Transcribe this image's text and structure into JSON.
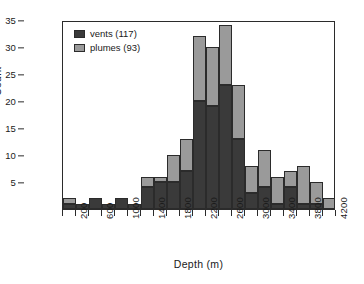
{
  "chart_data": {
    "type": "bar",
    "subtype": "stacked-histogram",
    "title": "",
    "xlabel": "Depth (m)",
    "ylabel": "Count",
    "xlim": [
      0,
      4200
    ],
    "ylim": [
      0,
      35
    ],
    "bin_width": 200,
    "grid": false,
    "legend_position": "top-left",
    "x_tick_labels": [
      "200",
      "600",
      "1000",
      "1400",
      "1800",
      "2200",
      "2600",
      "3000",
      "3400",
      "3800",
      "4200"
    ],
    "x_tick_values": [
      200,
      600,
      1000,
      1400,
      1800,
      2200,
      2600,
      3000,
      3400,
      3800,
      4200
    ],
    "x_minor_tick_values": [
      0,
      400,
      800,
      1200,
      1600,
      2000,
      2400,
      2800,
      3200,
      3600,
      4000
    ],
    "y_tick_labels": [
      "5",
      "10",
      "15",
      "20",
      "25",
      "30",
      "35"
    ],
    "y_tick_values": [
      5,
      10,
      15,
      20,
      25,
      30,
      35
    ],
    "bin_starts": [
      0,
      200,
      400,
      600,
      800,
      1000,
      1200,
      1400,
      1600,
      1800,
      2000,
      2200,
      2400,
      2600,
      2800,
      3000,
      3200,
      3400,
      3600,
      3800,
      4000
    ],
    "bin_labels": [
      "0-200",
      "200-400",
      "400-600",
      "600-800",
      "800-1000",
      "1000-1200",
      "1200-1400",
      "1400-1600",
      "1600-1800",
      "1800-2000",
      "2000-2200",
      "2200-2400",
      "2400-2600",
      "2600-2800",
      "2800-3000",
      "3000-3200",
      "3200-3400",
      "3400-3600",
      "3600-3800",
      "3800-4000",
      "4000-4200"
    ],
    "series": [
      {
        "name": "vents (117)",
        "short_name": "vents",
        "count": 117,
        "color": "#3a3a3a",
        "values": [
          1,
          1,
          2,
          1,
          2,
          1,
          4,
          5,
          5,
          7,
          20,
          19,
          23,
          13,
          3,
          4,
          1,
          4,
          1,
          1,
          0
        ]
      },
      {
        "name": "plumes (93)",
        "short_name": "plumes",
        "count": 93,
        "color": "#9a9a9a",
        "values": [
          1,
          0,
          0,
          0,
          0,
          0,
          2,
          1,
          5,
          6,
          12,
          11,
          11,
          10,
          5,
          7,
          5,
          3,
          7,
          4,
          2
        ]
      }
    ],
    "totals": [
      2,
      1,
      2,
      1,
      2,
      1,
      6,
      6,
      10,
      13,
      32,
      30,
      34,
      23,
      8,
      11,
      6,
      7,
      8,
      5,
      2
    ]
  },
  "legend": {
    "entries": [
      {
        "label": "vents (117)",
        "color": "#3a3a3a"
      },
      {
        "label": "plumes (93)",
        "color": "#9a9a9a"
      }
    ]
  },
  "axes": {
    "x_title": "Depth (m)",
    "y_title": "Count"
  },
  "style": {
    "frame_color": "#2b2b2b",
    "background": "#ffffff",
    "vents_color": "#3a3a3a",
    "plumes_color": "#9a9a9a"
  }
}
